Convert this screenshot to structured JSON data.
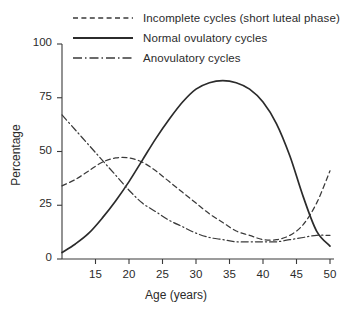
{
  "chart_data": {
    "type": "line",
    "title": "",
    "xlabel": "Age (years)",
    "ylabel": "Percentage",
    "xlim": [
      10,
      50
    ],
    "ylim": [
      0,
      100
    ],
    "xticks": [
      15,
      20,
      25,
      30,
      35,
      40,
      45,
      50
    ],
    "yticks": [
      0,
      25,
      50,
      75,
      100
    ],
    "grid": false,
    "legend_position": "top-left",
    "series": [
      {
        "name": "Incomplete cycles (short luteal phase)",
        "style": "dashed",
        "color": "#3a3a3a",
        "x": [
          10,
          12,
          14,
          16,
          18,
          20,
          22,
          24,
          26,
          28,
          30,
          32,
          34,
          36,
          38,
          40,
          42,
          44,
          46,
          48,
          50
        ],
        "values": [
          34,
          37,
          41,
          45,
          47,
          47,
          45,
          41,
          36,
          31,
          26,
          21,
          17,
          13,
          11,
          9,
          9,
          11,
          16,
          26,
          41
        ]
      },
      {
        "name": "Normal ovulatory cycles",
        "style": "solid",
        "color": "#2b2b2b",
        "x": [
          10,
          12,
          14,
          16,
          18,
          20,
          22,
          24,
          26,
          28,
          30,
          32,
          34,
          36,
          38,
          40,
          42,
          44,
          46,
          48,
          50
        ],
        "values": [
          3,
          7,
          12,
          19,
          27,
          36,
          46,
          56,
          65,
          73,
          79,
          82,
          83,
          82,
          79,
          73,
          63,
          48,
          29,
          13,
          6
        ]
      },
      {
        "name": "Anovulatory cycles",
        "style": "dash-dot",
        "color": "#3a3a3a",
        "x": [
          10,
          12,
          14,
          16,
          18,
          20,
          22,
          24,
          26,
          28,
          30,
          32,
          34,
          36,
          38,
          40,
          42,
          44,
          46,
          48,
          50
        ],
        "values": [
          67,
          60,
          53,
          46,
          39,
          32,
          26,
          22,
          18,
          15,
          12,
          10,
          9,
          8,
          8,
          8,
          8,
          9,
          10,
          11,
          11
        ]
      }
    ]
  },
  "legend": {
    "items": [
      {
        "label": "Incomplete cycles (short luteal phase)"
      },
      {
        "label": "Normal ovulatory cycles"
      },
      {
        "label": "Anovulatory cycles"
      }
    ]
  },
  "axes": {
    "y_title": "Percentage",
    "x_title": "Age (years)",
    "y_tick_labels": [
      "0",
      "25",
      "50",
      "75",
      "100"
    ],
    "x_tick_labels": [
      "15",
      "20",
      "25",
      "30",
      "35",
      "40",
      "45",
      "50"
    ]
  }
}
